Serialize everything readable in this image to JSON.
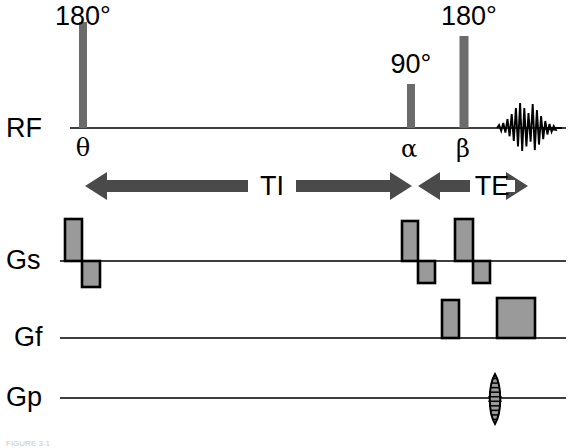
{
  "figure": {
    "type": "mri-pulse-sequence-diagram",
    "caption": "FIGURE 3-1",
    "background_color": "#ffffff",
    "line_color": "#3f3f3f",
    "pulse_fill_color": "#6b6b6b",
    "gradient_fill_color": "#9a9a9a",
    "gradient_stroke_color": "#000000",
    "arrow_color": "#4a4a4a",
    "echo_color": "#000000"
  },
  "channels": [
    {
      "id": "rf",
      "label": "RF",
      "label_x": 6,
      "label_y": 137,
      "baseline_y": 128,
      "line_start_x": 70,
      "line_end_x": 566
    },
    {
      "id": "gs",
      "label": "Gs",
      "label_x": 6,
      "label_y": 269,
      "baseline_y": 261,
      "line_start_x": 60,
      "line_end_x": 566
    },
    {
      "id": "gf",
      "label": "Gf",
      "label_x": 14,
      "label_y": 346,
      "baseline_y": 338,
      "line_start_x": 60,
      "line_end_x": 566
    },
    {
      "id": "gp",
      "label": "Gp",
      "label_x": 6,
      "label_y": 406,
      "baseline_y": 398,
      "line_start_x": 60,
      "line_end_x": 566
    }
  ],
  "rf_pulses": [
    {
      "name": "inversion-pulse",
      "flip_angle_label": "180°",
      "time_symbol": "θ",
      "x": 83,
      "width": 8,
      "height": 106,
      "label_x": 83,
      "label_y": 25,
      "symbol_x": 83,
      "symbol_y": 156
    },
    {
      "name": "excitation-pulse",
      "flip_angle_label": "90°",
      "time_symbol": "α",
      "x": 411,
      "width": 8,
      "height": 44,
      "label_x": 411,
      "label_y": 73,
      "symbol_x": 409,
      "symbol_y": 157
    },
    {
      "name": "refocusing-pulse",
      "flip_angle_label": "180°",
      "time_symbol": "β",
      "x": 464,
      "width": 9,
      "height": 92,
      "label_x": 469,
      "label_y": 25,
      "symbol_x": 463,
      "symbol_y": 157
    }
  ],
  "echo_signal": {
    "name": "spin-echo-signal",
    "center_x": 527,
    "baseline_y": 128,
    "tail_end_x": 562
  },
  "intervals": [
    {
      "id": "ti",
      "label": "TI",
      "label_x": 272,
      "label_y": 195,
      "axis_y": 186,
      "left_x": 85,
      "right_x": 412,
      "gap_left": 248,
      "gap_right": 296,
      "head_len": 22,
      "shaft_half": 6,
      "head_half": 14
    },
    {
      "id": "te",
      "label": "TE",
      "label_x": 492,
      "label_y": 195,
      "axis_y": 186,
      "left_x": 418,
      "right_x": 528,
      "gap_left": 470,
      "gap_right": 515,
      "head_len": 22,
      "shaft_half": 6,
      "head_half": 14
    }
  ],
  "gradient_lobes": [
    {
      "channel": "gs",
      "name": "slice-select-lobe-inversion",
      "x": 65,
      "width": 17,
      "height": 42,
      "polarity": "positive"
    },
    {
      "channel": "gs",
      "name": "slice-rephase-lobe-inversion",
      "x": 82,
      "width": 18,
      "height": 26,
      "polarity": "negative"
    },
    {
      "channel": "gs",
      "name": "slice-select-lobe-excitation",
      "x": 402,
      "width": 16,
      "height": 40,
      "polarity": "positive"
    },
    {
      "channel": "gs",
      "name": "slice-rephase-lobe-excitation",
      "x": 418,
      "width": 17,
      "height": 22,
      "polarity": "negative"
    },
    {
      "channel": "gs",
      "name": "slice-select-lobe-refocus",
      "x": 455,
      "width": 18,
      "height": 42,
      "polarity": "positive"
    },
    {
      "channel": "gs",
      "name": "slice-rephase-lobe-refocus",
      "x": 473,
      "width": 17,
      "height": 22,
      "polarity": "negative"
    },
    {
      "channel": "gf",
      "name": "readout-dephase-lobe",
      "x": 442,
      "width": 17,
      "height": 38,
      "polarity": "positive"
    },
    {
      "channel": "gf",
      "name": "readout-gradient-lobe",
      "x": 497,
      "width": 38,
      "height": 40,
      "polarity": "positive"
    }
  ],
  "phase_encode": {
    "name": "phase-encode-ladder",
    "channel": "gp",
    "center_x": 495,
    "top_y": 374,
    "bottom_y": 424,
    "half_width": 7,
    "step_count": 11
  }
}
